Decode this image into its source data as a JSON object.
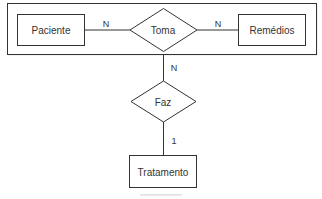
{
  "diagram": {
    "type": "er-diagram",
    "aggregation": {
      "label": ""
    },
    "entities": [
      {
        "id": "paciente",
        "label": "Paciente"
      },
      {
        "id": "remedios",
        "label": "Remédios"
      },
      {
        "id": "tratamento",
        "label": "Tratamento"
      }
    ],
    "relationships": [
      {
        "id": "toma",
        "label": "Toma"
      },
      {
        "id": "faz",
        "label": "Faz"
      }
    ],
    "cardinalities": {
      "paciente_toma": "N",
      "toma_remedios": "N",
      "aggregation_faz": "N",
      "faz_tratamento": "1"
    }
  }
}
